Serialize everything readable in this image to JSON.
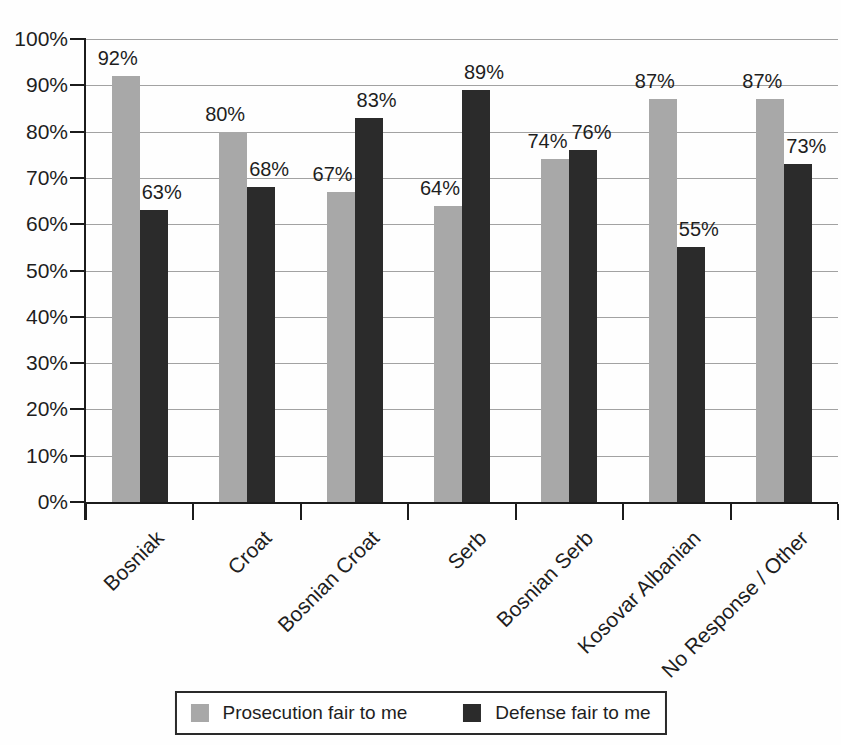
{
  "chart_data": {
    "type": "bar",
    "title": "",
    "xlabel": "",
    "ylabel": "",
    "categories": [
      "Bosniak",
      "Croat",
      "Bosnian Croat",
      "Serb",
      "Bosnian Serb",
      "Kosovar Albanian",
      "No Response / Other"
    ],
    "series": [
      {
        "name": "Prosecution fair to me",
        "color": "#a8a8a8",
        "values": [
          92,
          80,
          67,
          64,
          74,
          87,
          87
        ]
      },
      {
        "name": "Defense fair to me",
        "color": "#2b2b2b",
        "values": [
          63,
          68,
          83,
          89,
          76,
          55,
          73
        ]
      }
    ],
    "data_label_suffix": "%",
    "ylim": [
      0,
      100
    ],
    "ytick_step": 10,
    "ytick_labels": [
      "0%",
      "10%",
      "20%",
      "30%",
      "40%",
      "50%",
      "60%",
      "70%",
      "80%",
      "90%",
      "100%"
    ],
    "grid": true,
    "gridline_color": "#a2a2a2",
    "axis_color": "#1b1b1b",
    "text_color": "#1e1e1e",
    "legend_position": "bottom",
    "legend_border_color": "#2a2a2a"
  }
}
